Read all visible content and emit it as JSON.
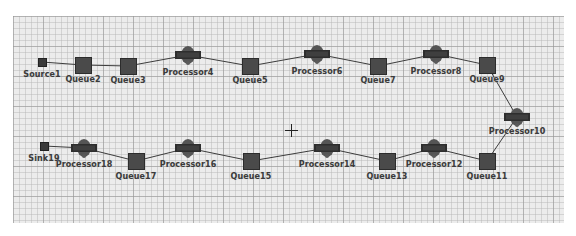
{
  "canvas": {
    "background": "#ececec",
    "grid_color": "#969696",
    "cursor": {
      "icon": "crosshair-icon",
      "x": 291,
      "y": 130
    }
  },
  "colors": {
    "queue_fill": "#4a4a4a",
    "processor_fill": "#3a3a3a",
    "link": "#3c3c3c",
    "label": "#3b3b3b"
  },
  "nodes": [
    {
      "id": "Source1",
      "type": "source",
      "label": "Source1",
      "x": 42,
      "y": 62,
      "lx": 42,
      "ly": 70
    },
    {
      "id": "Queue2",
      "type": "queue",
      "label": "Queue2",
      "x": 83,
      "y": 65,
      "lx": 83,
      "ly": 75
    },
    {
      "id": "Queue3",
      "type": "queue",
      "label": "Queue3",
      "x": 128,
      "y": 66,
      "lx": 128,
      "ly": 76
    },
    {
      "id": "Processor4",
      "type": "processor",
      "label": "Processor4",
      "x": 188,
      "y": 55,
      "lx": 188,
      "ly": 68
    },
    {
      "id": "Queue5",
      "type": "queue",
      "label": "Queue5",
      "x": 250,
      "y": 66,
      "lx": 250,
      "ly": 76
    },
    {
      "id": "Processor6",
      "type": "processor",
      "label": "Processor6",
      "x": 317,
      "y": 54,
      "lx": 317,
      "ly": 67
    },
    {
      "id": "Queue7",
      "type": "queue",
      "label": "Queue7",
      "x": 378,
      "y": 66,
      "lx": 378,
      "ly": 76
    },
    {
      "id": "Processor8",
      "type": "processor",
      "label": "Processor8",
      "x": 436,
      "y": 54,
      "lx": 436,
      "ly": 67
    },
    {
      "id": "Queue9",
      "type": "queue",
      "label": "Queue9",
      "x": 487,
      "y": 65,
      "lx": 487,
      "ly": 75
    },
    {
      "id": "Processor10",
      "type": "processor",
      "label": "Processor10",
      "x": 517,
      "y": 117,
      "lx": 517,
      "ly": 127
    },
    {
      "id": "Queue11",
      "type": "queue",
      "label": "Queue11",
      "x": 487,
      "y": 161,
      "lx": 487,
      "ly": 172
    },
    {
      "id": "Processor12",
      "type": "processor",
      "label": "Processor12",
      "x": 434,
      "y": 148,
      "lx": 434,
      "ly": 160
    },
    {
      "id": "Queue13",
      "type": "queue",
      "label": "Queue13",
      "x": 387,
      "y": 161,
      "lx": 387,
      "ly": 172
    },
    {
      "id": "Processor14",
      "type": "processor",
      "label": "Processor14",
      "x": 327,
      "y": 148,
      "lx": 327,
      "ly": 160
    },
    {
      "id": "Queue15",
      "type": "queue",
      "label": "Queue15",
      "x": 251,
      "y": 161,
      "lx": 251,
      "ly": 172
    },
    {
      "id": "Processor16",
      "type": "processor",
      "label": "Processor16",
      "x": 188,
      "y": 148,
      "lx": 188,
      "ly": 160
    },
    {
      "id": "Queue17",
      "type": "queue",
      "label": "Queue17",
      "x": 136,
      "y": 161,
      "lx": 136,
      "ly": 172
    },
    {
      "id": "Processor18",
      "type": "processor",
      "label": "Processor18",
      "x": 84,
      "y": 148,
      "lx": 84,
      "ly": 160
    },
    {
      "id": "Sink19",
      "type": "sink",
      "label": "Sink19",
      "x": 44,
      "y": 146,
      "lx": 44,
      "ly": 154
    }
  ],
  "links": [
    [
      "Source1",
      "Queue2"
    ],
    [
      "Queue2",
      "Queue3"
    ],
    [
      "Queue3",
      "Processor4"
    ],
    [
      "Processor4",
      "Queue5"
    ],
    [
      "Queue5",
      "Processor6"
    ],
    [
      "Processor6",
      "Queue7"
    ],
    [
      "Queue7",
      "Processor8"
    ],
    [
      "Processor8",
      "Queue9"
    ],
    [
      "Queue9",
      "Processor10"
    ],
    [
      "Processor10",
      "Queue11"
    ],
    [
      "Queue11",
      "Processor12"
    ],
    [
      "Processor12",
      "Queue13"
    ],
    [
      "Queue13",
      "Processor14"
    ],
    [
      "Processor14",
      "Queue15"
    ],
    [
      "Queue15",
      "Processor16"
    ],
    [
      "Processor16",
      "Queue17"
    ],
    [
      "Queue17",
      "Processor18"
    ],
    [
      "Processor18",
      "Sink19"
    ]
  ]
}
